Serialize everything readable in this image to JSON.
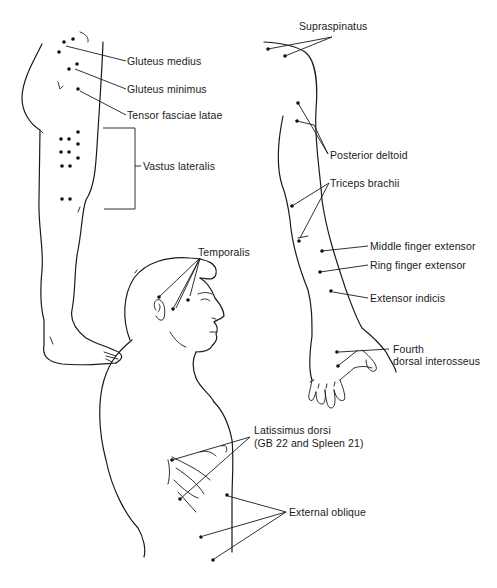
{
  "figure": {
    "type": "anatomical trigger point diagram",
    "views": [
      "lateral hip and leg",
      "posterior arm and hand",
      "head in profile",
      "lateral torso"
    ]
  },
  "labels": {
    "gluteus_medius": "Gluteus medius",
    "gluteus_minimus": "Gluteus minimus",
    "tensor_fasciae_latae": "Tensor fasciae latae",
    "vastus_lateralis": "Vastus lateralis",
    "supraspinatus": "Supraspinatus",
    "posterior_deltoid": "Posterior deltoid",
    "triceps_brachii": "Triceps brachii",
    "middle_finger_extensor": "Middle finger extensor",
    "ring_finger_extensor": "Ring finger extensor",
    "extensor_indicis": "Extensor indicis",
    "fourth_dorsal_interosseus_line1": "Fourth",
    "fourth_dorsal_interosseus_line2": "dorsal interosseus",
    "temporalis": "Temporalis",
    "latissimus_dorsi_line1": "Latissimus dorsi",
    "latissimus_dorsi_line2": "(GB 22 and Spleen 21)",
    "external_oblique": "External oblique"
  },
  "colors": {
    "ink": "#1a1a1a",
    "background": "#ffffff"
  }
}
